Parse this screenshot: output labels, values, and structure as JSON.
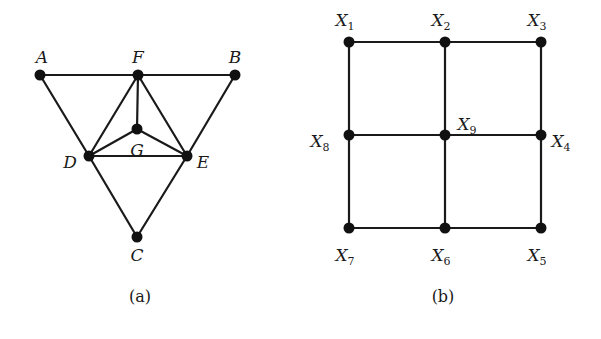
{
  "figure": {
    "panels": [
      {
        "id": "a",
        "caption": "(a)",
        "nodes": [
          {
            "id": "A",
            "label": "A",
            "x": 40,
            "y": 75,
            "lx": 42,
            "ly": 63
          },
          {
            "id": "F",
            "label": "F",
            "x": 138,
            "y": 75,
            "lx": 138,
            "ly": 63
          },
          {
            "id": "B",
            "label": "B",
            "x": 235,
            "y": 75,
            "lx": 235,
            "ly": 63
          },
          {
            "id": "G",
            "label": "G",
            "x": 137,
            "y": 129,
            "lx": 137,
            "ly": 156
          },
          {
            "id": "D",
            "label": "D",
            "x": 89,
            "y": 156,
            "lx": 70,
            "ly": 168
          },
          {
            "id": "E",
            "label": "E",
            "x": 187,
            "y": 156,
            "lx": 203,
            "ly": 168
          },
          {
            "id": "C",
            "label": "C",
            "x": 137,
            "y": 237,
            "lx": 137,
            "ly": 261
          }
        ],
        "edges": [
          [
            "A",
            "F"
          ],
          [
            "F",
            "B"
          ],
          [
            "A",
            "D"
          ],
          [
            "D",
            "C"
          ],
          [
            "B",
            "E"
          ],
          [
            "E",
            "C"
          ],
          [
            "F",
            "D"
          ],
          [
            "F",
            "E"
          ],
          [
            "F",
            "G"
          ],
          [
            "G",
            "D"
          ],
          [
            "G",
            "E"
          ],
          [
            "D",
            "E"
          ]
        ]
      },
      {
        "id": "b",
        "caption": "(b)",
        "nodes": [
          {
            "id": "X1",
            "label": "X",
            "sub": "1",
            "x": 349,
            "y": 42,
            "lx": 345,
            "ly": 26
          },
          {
            "id": "X2",
            "label": "X",
            "sub": "2",
            "x": 445,
            "y": 42,
            "lx": 441,
            "ly": 26
          },
          {
            "id": "X3",
            "label": "X",
            "sub": "3",
            "x": 541,
            "y": 42,
            "lx": 537,
            "ly": 26
          },
          {
            "id": "X4",
            "label": "X",
            "sub": "4",
            "x": 541,
            "y": 135,
            "lx": 561,
            "ly": 147
          },
          {
            "id": "X5",
            "label": "X",
            "sub": "5",
            "x": 541,
            "y": 228,
            "lx": 537,
            "ly": 261
          },
          {
            "id": "X6",
            "label": "X",
            "sub": "6",
            "x": 445,
            "y": 228,
            "lx": 441,
            "ly": 261
          },
          {
            "id": "X7",
            "label": "X",
            "sub": "7",
            "x": 349,
            "y": 228,
            "lx": 345,
            "ly": 261
          },
          {
            "id": "X8",
            "label": "X",
            "sub": "8",
            "x": 349,
            "y": 135,
            "lx": 320,
            "ly": 147
          },
          {
            "id": "X9",
            "label": "X",
            "sub": "9",
            "x": 445,
            "y": 135,
            "lx": 467,
            "ly": 130
          }
        ],
        "edges": [
          [
            "X1",
            "X2"
          ],
          [
            "X2",
            "X3"
          ],
          [
            "X8",
            "X9"
          ],
          [
            "X9",
            "X4"
          ],
          [
            "X7",
            "X6"
          ],
          [
            "X6",
            "X5"
          ],
          [
            "X1",
            "X8"
          ],
          [
            "X8",
            "X7"
          ],
          [
            "X2",
            "X9"
          ],
          [
            "X9",
            "X6"
          ],
          [
            "X3",
            "X4"
          ],
          [
            "X4",
            "X5"
          ]
        ]
      }
    ],
    "captions": [
      {
        "text": "(a)",
        "x": 140,
        "y": 302
      },
      {
        "text": "(b)",
        "x": 443,
        "y": 302
      }
    ],
    "colors": {
      "ink": "#1a1a1a",
      "background": "#ffffff"
    }
  }
}
